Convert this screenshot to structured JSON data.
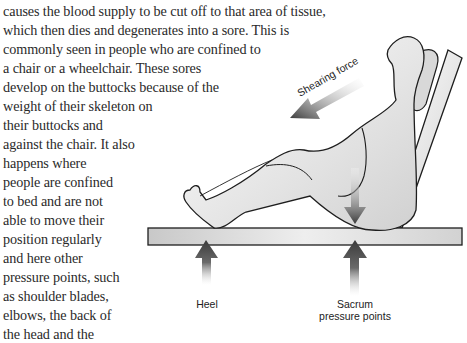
{
  "body_text": {
    "lines": [
      "causes the blood supply to be cut off to that area of tissue,",
      "which then dies and degenerates into a sore. This is",
      "commonly seen in people who are confined to",
      "a chair or a wheelchair. These sores",
      "develop on the buttocks because of the",
      "weight of their skeleton on",
      "their buttocks and",
      "against the chair. It also",
      "happens where",
      "people are confined",
      "to bed and are not",
      "able to move their",
      "position regularly",
      "and here other",
      "pressure points, such",
      "as shoulder blades,",
      "elbows, the back of",
      "the head and the",
      "heels, are all likely to",
      "suffer sores as a result"
    ]
  },
  "figure": {
    "shearing_force_label": "Shearing force",
    "heel_label": "Heel",
    "sacrum_label_line1": "Sacrum",
    "sacrum_label_line2": "pressure points"
  },
  "colors": {
    "text": "#2a2a2a",
    "outline": "#1e1e1e",
    "arrow_dark": "#3a3a3a",
    "shade": "#cfcfcf"
  }
}
